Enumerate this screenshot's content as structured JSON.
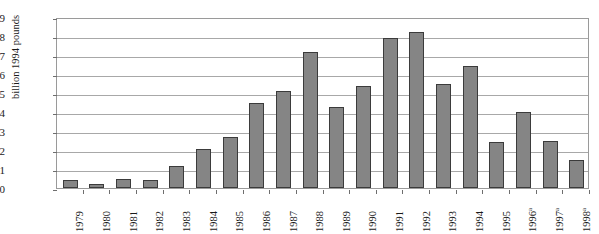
{
  "chart_data": {
    "type": "bar",
    "title": "",
    "xlabel": "",
    "ylabel": "billion 1994 pounds",
    "ylim": [
      0,
      9
    ],
    "yticks": [
      0,
      1,
      2,
      3,
      4,
      5,
      6,
      7,
      8,
      9
    ],
    "grid": true,
    "legend": null,
    "bar_color": "#858585",
    "bar_outline_color": "#3b3b3b",
    "categories": [
      "1979",
      "1980",
      "1981",
      "1982",
      "1983",
      "1984",
      "1985",
      "1986",
      "1987",
      "1988",
      "1989",
      "1990",
      "1991",
      "1992",
      "1993",
      "1994",
      "1995",
      "1996",
      "1997",
      "1998"
    ],
    "category_footnotes": [
      "",
      "",
      "",
      "",
      "",
      "",
      "",
      "",
      "",
      "",
      "",
      "",
      "",
      "",
      "",
      "",
      "",
      "a",
      "a",
      "a"
    ],
    "values": [
      0.4,
      0.2,
      0.45,
      0.4,
      1.15,
      2.05,
      2.7,
      4.5,
      5.1,
      7.15,
      4.25,
      5.35,
      7.9,
      8.2,
      5.45,
      6.4,
      2.4,
      4.0,
      2.45,
      1.5
    ]
  }
}
